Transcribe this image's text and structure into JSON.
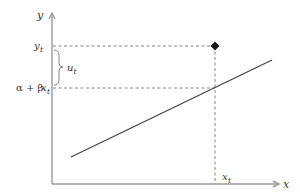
{
  "diagram": {
    "title": "",
    "axes": {
      "x_label": "x",
      "y_label": "y"
    },
    "labels": {
      "y_t": {
        "main": "y",
        "sub": "t"
      },
      "u_t": {
        "main": "u",
        "sub": "t"
      },
      "fitted": {
        "alpha_plus": "α + β",
        "x": "x",
        "sub": "t"
      },
      "x_t": {
        "main": "x",
        "sub": "t"
      }
    },
    "elements": {
      "regression_line": "α + βx",
      "observation_marker": "diamond",
      "residual_brace": "brace"
    },
    "colors": {
      "axis": "#9a9a9a",
      "line": "#444444",
      "guide": "#777777",
      "marker": "#1a1a1a"
    }
  }
}
